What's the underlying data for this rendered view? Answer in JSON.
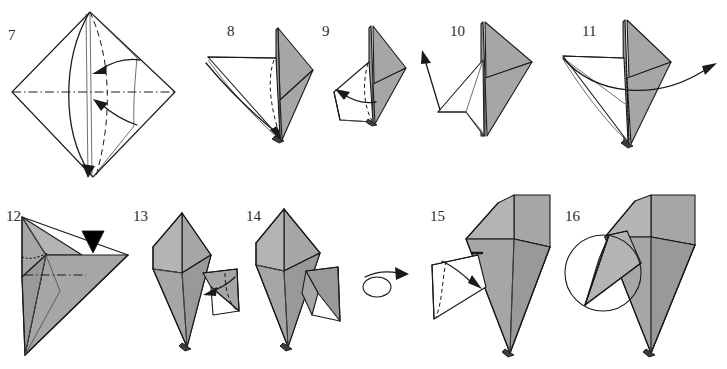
{
  "document": {
    "title": "Origami folding instructions, steps 7-16",
    "page_background": "#ffffff",
    "ink_color": "#1a1a1a",
    "paper_gray": "#a6a6a6",
    "paper_white": "#ffffff"
  },
  "rows": [
    {
      "row_name": "top-row",
      "steps": [
        {
          "number": "7",
          "figure": "square-base-diamond-with-petal-fold-arrows",
          "symbols": [
            "valley-fold-dashed",
            "mountain-fold-dash-dot",
            "curved-fold-arrow",
            "curved-fold-arrow",
            "long-fold-arrow"
          ]
        },
        {
          "number": "8",
          "figure": "folded-flap-three-quarter-view",
          "symbols": [
            "valley-fold-dashed",
            "curved-fold-arrow"
          ]
        },
        {
          "number": "9",
          "figure": "narrow-flap-with-inside-reverse-fold",
          "symbols": [
            "valley-fold-dashed",
            "curved-fold-arrow"
          ]
        },
        {
          "number": "10",
          "figure": "opened-flap-pointing-left",
          "symbols": [
            "straight-fold-arrow"
          ]
        },
        {
          "number": "11",
          "figure": "wide-flap-with-sweeping-arrow",
          "symbols": [
            "dotted-hidden-edge",
            "long-curved-arrow-right"
          ]
        }
      ]
    },
    {
      "row_name": "bottom-row",
      "steps": [
        {
          "number": "12",
          "figure": "gray-arrowhead-shape-with-push-symbol",
          "symbols": [
            "push-in-solid-black-triangle",
            "dotted-hidden-edge",
            "mountain-fold-dash-dot"
          ]
        },
        {
          "number": "13",
          "figure": "bird-form-with-inside-reverse-fold",
          "symbols": [
            "valley-fold-dashed",
            "curved-fold-arrow"
          ]
        },
        {
          "number": "14",
          "figure": "bird-form-completed-leg",
          "symbols": []
        },
        {
          "number": "15",
          "figure": "bird-form-reversed-with-fold-arrow",
          "symbols": [
            "valley-fold-dashed",
            "curved-fold-arrow"
          ]
        },
        {
          "number": "16",
          "figure": "bird-form-with-zoom-circle",
          "symbols": [
            "detail-circle"
          ]
        }
      ]
    }
  ],
  "between_steps": [
    {
      "name": "turn-over-symbol",
      "between": "14-and-15",
      "meaning": "turn the model over",
      "glyph": "loop-with-arrow"
    }
  ]
}
